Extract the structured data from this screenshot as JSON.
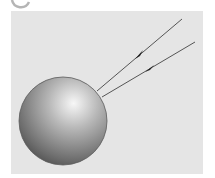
{
  "figure": {
    "colors": {
      "background": "#ffffff",
      "panel": "#e5e5e5",
      "ray": "#555555",
      "sphere_light": "#f4f4f4",
      "sphere_mid": "#a6a6a6",
      "sphere_dark": "#4a4a4a",
      "badge_ring": "#b5b5b5"
    },
    "sphere": {
      "cx": 63,
      "cy": 121,
      "r": 44
    },
    "rays": [
      {
        "x1": 182,
        "y1": 19,
        "x2": 97,
        "y2": 91,
        "arrow_at": [
          138,
          56
        ]
      },
      {
        "x1": 195,
        "y1": 42,
        "x2": 102,
        "y2": 97,
        "arrow_at": [
          148,
          70
        ]
      }
    ]
  }
}
